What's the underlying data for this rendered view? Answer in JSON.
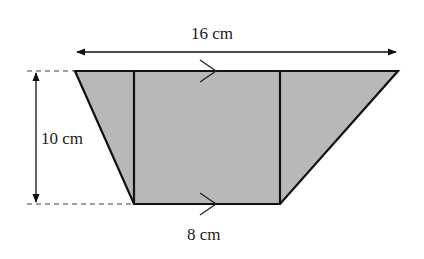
{
  "figure": {
    "shape": "trapezium",
    "fill_color": "#b8b8b8",
    "stroke_color": "#111111",
    "labels": {
      "top_width": "16 cm",
      "height": "10 cm",
      "bottom_width": "8 cm"
    },
    "parallel_marks": [
      "top-edge",
      "bottom-edge"
    ],
    "regions": [
      "left-triangle",
      "central-rectangle",
      "right-triangle"
    ]
  }
}
